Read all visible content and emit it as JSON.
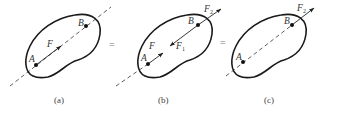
{
  "figure": {
    "panels": [
      {
        "id": "a",
        "caption": "(a)",
        "points": {
          "A": "A",
          "B": "B"
        },
        "forces": [
          {
            "label": "F",
            "sub": "",
            "at": "A",
            "direction": "A-to-B"
          }
        ]
      },
      {
        "id": "b",
        "caption": "(b)",
        "points": {
          "A": "A",
          "B": "B"
        },
        "forces": [
          {
            "label": "F",
            "sub": "",
            "at": "A",
            "direction": "A-to-B"
          },
          {
            "label": "F",
            "sub": "1",
            "at": "B",
            "direction": "B-to-A"
          },
          {
            "label": "F",
            "sub": "2",
            "at": "B",
            "direction": "A-to-B"
          }
        ]
      },
      {
        "id": "c",
        "caption": "(c)",
        "points": {
          "A": "A",
          "B": "B"
        },
        "forces": [
          {
            "label": "F",
            "sub": "2",
            "at": "B",
            "direction": "A-to-B"
          }
        ]
      }
    ],
    "equals": [
      "=",
      "="
    ]
  }
}
